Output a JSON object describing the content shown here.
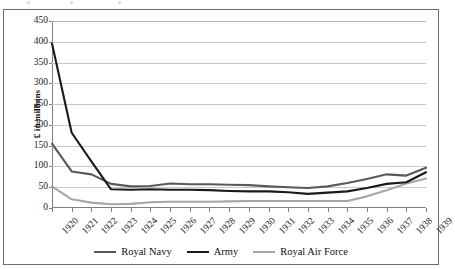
{
  "chart_data": {
    "type": "line",
    "title": "",
    "subtitle": "",
    "xlabel": "",
    "ylabel": "£ in millions",
    "categories": [
      "1920",
      "1921",
      "1922",
      "1923",
      "1924",
      "1925",
      "1926",
      "1927",
      "1928",
      "1929",
      "1930",
      "1931",
      "1932",
      "1933",
      "1934",
      "1935",
      "1936",
      "1937",
      "1938",
      "1939"
    ],
    "x": [
      1920,
      1921,
      1922,
      1923,
      1924,
      1925,
      1926,
      1927,
      1928,
      1929,
      1930,
      1931,
      1932,
      1933,
      1934,
      1935,
      1936,
      1937,
      1938,
      1939
    ],
    "ylim": [
      0,
      450
    ],
    "yticks": [
      0,
      50,
      100,
      150,
      200,
      250,
      300,
      350,
      400,
      450
    ],
    "ytick_labels": [
      "0",
      "50",
      "100",
      "150",
      "200",
      "250",
      "300",
      "350",
      "400",
      "450"
    ],
    "grid": true,
    "grid_axis": "y",
    "legend_position": "bottom",
    "series": [
      {
        "name": "Royal Navy",
        "color": "#595959",
        "values": [
          155,
          88,
          81,
          58,
          52,
          53,
          59,
          57,
          57,
          56,
          55,
          52,
          50,
          48,
          52,
          60,
          70,
          81,
          78,
          97
        ]
      },
      {
        "name": "Army",
        "color": "#1a1a1a",
        "values": [
          396,
          181,
          112,
          45,
          44,
          45,
          44,
          44,
          43,
          41,
          40,
          40,
          38,
          34,
          37,
          40,
          48,
          58,
          62,
          86
        ]
      },
      {
        "name": "Royal Air Force",
        "color": "#a6a6a6",
        "values": [
          52,
          21,
          13,
          9,
          10,
          14,
          15,
          15,
          15,
          16,
          17,
          17,
          17,
          17,
          17,
          17,
          28,
          43,
          59,
          71
        ]
      }
    ]
  },
  "legend": {
    "items": [
      {
        "label": "Royal Navy",
        "color": "#595959"
      },
      {
        "label": "Army",
        "color": "#1a1a1a"
      },
      {
        "label": "Royal Air Force",
        "color": "#a6a6a6"
      }
    ]
  }
}
